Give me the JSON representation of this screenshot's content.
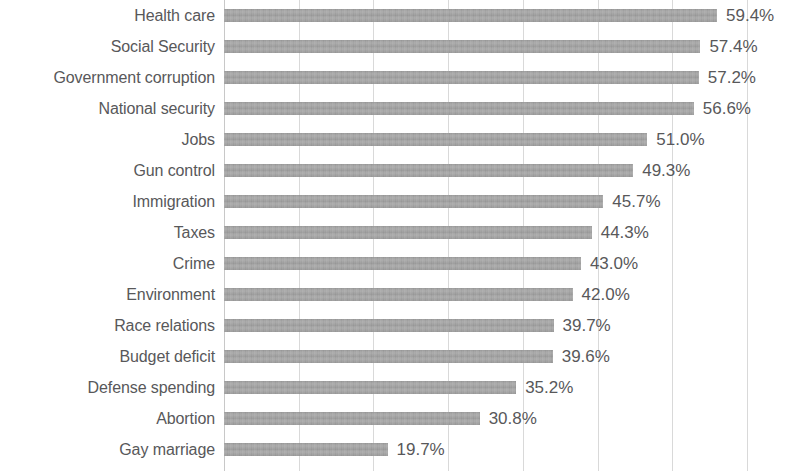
{
  "chart_data": {
    "type": "bar",
    "orientation": "horizontal",
    "title": "",
    "subtitle": "",
    "xlabel": "",
    "ylabel": "",
    "xlim": [
      0,
      67
    ],
    "grid": true,
    "gridlines_axis": "x",
    "legend": false,
    "legend_position": "none",
    "value_format": "percent_one_decimal",
    "bar_color": "#9a9a9a",
    "label_color": "#58585a",
    "gridline_color": "#d9d9d9",
    "background": "#ffffff",
    "categories": [
      "Health care",
      "Social Security",
      "Government corruption",
      "National security",
      "Jobs",
      "Gun control",
      "Immigration",
      "Taxes",
      "Crime",
      "Environment",
      "Race relations",
      "Budget deficit",
      "Defense spending",
      "Abortion",
      "Gay marriage"
    ],
    "values": [
      59.4,
      57.4,
      57.2,
      56.6,
      51.0,
      49.3,
      45.7,
      44.3,
      43.0,
      42.0,
      39.7,
      39.6,
      35.2,
      30.8,
      19.7
    ],
    "value_labels": [
      "59.4%",
      "57.4%",
      "57.2%",
      "56.6%",
      "51.0%",
      "49.3%",
      "45.7%",
      "44.3%",
      "43.0%",
      "42.0%",
      "39.7%",
      "39.6%",
      "35.2%",
      "30.8%",
      "19.7%"
    ],
    "tick_values": [
      0,
      9,
      18,
      27,
      36,
      45,
      54,
      63
    ],
    "tick_labels": [
      "",
      "",
      "",
      "",
      "",
      "",
      "",
      ""
    ]
  }
}
